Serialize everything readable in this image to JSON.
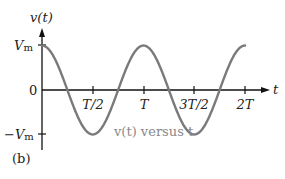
{
  "figure": {
    "panel_label": "(b)",
    "y_axis_label": "v(t)",
    "x_axis_label": "t",
    "y_tick_labels": {
      "max": "V",
      "max_sub": "m",
      "zero": "0",
      "min": "−V",
      "min_sub": "m"
    },
    "x_tick_labels": [
      "T/2",
      "T",
      "3T/2",
      "2T"
    ],
    "curve_caption": "v(t) versus t",
    "colors": {
      "curve": "#7a7a7a",
      "axes": "#111111",
      "caption": "#888888"
    }
  },
  "chart_data": {
    "type": "line",
    "title": "v(t) versus t",
    "xlabel": "t",
    "ylabel": "v(t)",
    "function": "v(t) = Vm·cos(2πt/T)",
    "x_ticks": [
      "T/2",
      "T",
      "3T/2",
      "2T"
    ],
    "y_ticks": [
      "−Vm",
      "0",
      "Vm"
    ],
    "x": [
      0,
      0.25,
      0.5,
      0.75,
      1.0,
      1.25,
      1.5,
      1.75,
      2.0
    ],
    "x_units": "T",
    "values": [
      1,
      0,
      -1,
      0,
      1,
      0,
      -1,
      0,
      1
    ],
    "y_units": "Vm",
    "xlim": [
      0,
      2
    ],
    "ylim": [
      -1,
      1
    ],
    "grid": false,
    "legend": "none"
  }
}
